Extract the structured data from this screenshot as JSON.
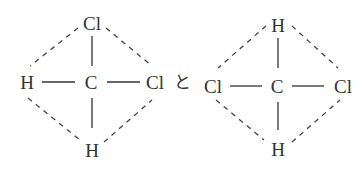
{
  "diagram": {
    "type": "structural-formula-comparison",
    "connector": "と",
    "molecules": [
      {
        "name": "left-molecule",
        "center": "C",
        "top": "Cl",
        "left": "H",
        "right": "Cl",
        "bottom": "H"
      },
      {
        "name": "right-molecule",
        "center": "C",
        "top": "H",
        "left": "Cl",
        "right": "Cl",
        "bottom": "H"
      }
    ]
  }
}
